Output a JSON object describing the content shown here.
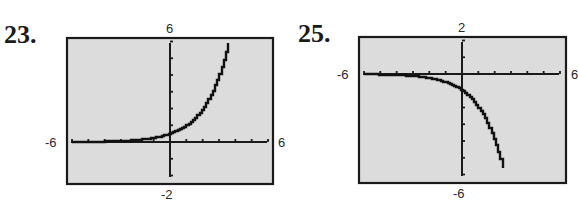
{
  "problems": [
    {
      "number": "23.",
      "window": {
        "xmin": "-6",
        "xmax": "6",
        "ymin": "-2",
        "ymax": "6"
      },
      "frame": {
        "left": 67,
        "top": 38,
        "right": 273,
        "bottom": 184
      },
      "axes_px": {
        "x0": 71,
        "x1": 267,
        "y_axis_x": 170,
        "y_top": 43,
        "y_bottom": 177,
        "x_axis_y": 142
      }
    },
    {
      "number": "25.",
      "window": {
        "xmin": "-6",
        "xmax": "6",
        "ymin": "-6",
        "ymax": "2"
      },
      "frame": {
        "left": 359,
        "top": 37,
        "right": 566,
        "bottom": 183
      },
      "axes_px": {
        "x0": 363,
        "x1": 559,
        "y_axis_x": 462,
        "y_top": 42,
        "y_bottom": 176,
        "x_axis_y": 74
      }
    }
  ],
  "colors": {
    "screen_bg": "#dcdcdc",
    "frame": "#1a1a1a",
    "curve": "#111111",
    "page_bg": "#ffffff"
  },
  "chart_data": [
    {
      "type": "line",
      "title": "23.",
      "xlabel": "",
      "ylabel": "",
      "xlim": [
        -6,
        6
      ],
      "ylim": [
        -2,
        6
      ],
      "grid": false,
      "x_ticks_step": 1,
      "y_ticks_step": 1,
      "window_labels": {
        "left": "-6",
        "right": "6",
        "top": "6",
        "bottom": "-2"
      },
      "series": [
        {
          "name": "f(x) ≈ 2^(x-1)",
          "x": [
            -6,
            -5,
            -4,
            -3,
            -2,
            -1,
            0,
            1,
            2,
            3,
            3.58
          ],
          "y": [
            0.008,
            0.016,
            0.031,
            0.063,
            0.125,
            0.25,
            0.5,
            1,
            2,
            4,
            6
          ]
        }
      ]
    },
    {
      "type": "line",
      "title": "25.",
      "xlabel": "",
      "ylabel": "",
      "xlim": [
        -6,
        6
      ],
      "ylim": [
        -6,
        2
      ],
      "grid": false,
      "x_ticks_step": 1,
      "y_ticks_step": 1,
      "window_labels": {
        "left": "-6",
        "right": "6",
        "top": "2",
        "bottom": "-6"
      },
      "series": [
        {
          "name": "f(x) ≈ -2^x",
          "x": [
            -6,
            -5,
            -4,
            -3,
            -2,
            -1,
            0,
            1,
            2,
            2.58
          ],
          "y": [
            -0.016,
            -0.031,
            -0.063,
            -0.125,
            -0.25,
            -0.5,
            -1,
            -2,
            -4,
            -6
          ]
        }
      ]
    }
  ]
}
